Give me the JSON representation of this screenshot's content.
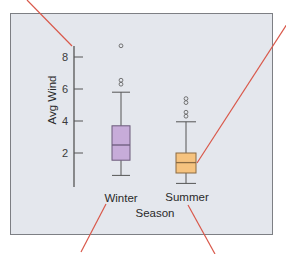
{
  "chart_data": {
    "type": "box",
    "title": "",
    "xlabel": "Season",
    "ylabel": "Avg Wind",
    "categories": [
      "Winter",
      "Summer"
    ],
    "yticks": [
      2,
      4,
      6,
      8
    ],
    "ylim": [
      0,
      9.5
    ],
    "grid": false,
    "series": [
      {
        "name": "Winter",
        "color": "#c7acd9",
        "stroke": "#6b5a7a",
        "whisker_low": 0.6,
        "q1": 1.55,
        "median": 2.5,
        "q3": 3.7,
        "whisker_high": 5.8,
        "outliers": [
          6.3,
          6.55,
          8.7
        ]
      },
      {
        "name": "Summer",
        "color": "#f6c37f",
        "stroke": "#8a6b42",
        "whisker_low": 0.1,
        "q1": 0.75,
        "median": 1.4,
        "q3": 2.0,
        "whisker_high": 3.95,
        "outliers": [
          4.3,
          4.55,
          5.15,
          5.4
        ]
      }
    ]
  },
  "annotations": {
    "pointer_color": "#d9584a",
    "pointers": [
      {
        "target": "y-axis",
        "from": [
          27,
          0
        ],
        "to": [
          72,
          46
        ]
      },
      {
        "target": "summer-box",
        "from": [
          287,
          24
        ],
        "to": [
          197,
          163
        ]
      },
      {
        "target": "winter-label",
        "from": [
          106,
          204
        ],
        "to": [
          81,
          252
        ]
      },
      {
        "target": "summer-label",
        "from": [
          188,
          205
        ],
        "to": [
          215,
          254
        ]
      }
    ]
  },
  "labels": {
    "ylabel": "Avg Wind",
    "xlabel": "Season",
    "cat_winter": "Winter",
    "cat_summer": "Summer"
  }
}
